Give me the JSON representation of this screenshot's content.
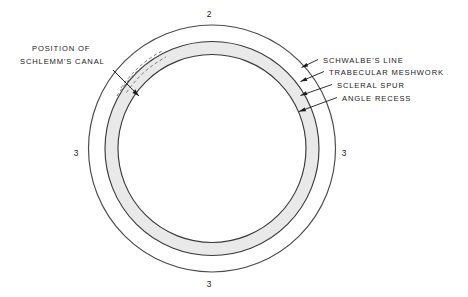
{
  "figure": {
    "background_color": "#ffffff",
    "ink_color": "#1a1a1a",
    "band_fill_color": "#e9e9e9",
    "band_stroke_color": "#3a3a3a",
    "outer_circle_stroke_color": "#4a4a4a"
  },
  "labels": {
    "left": {
      "name": "position-of-schlemms-canal",
      "line1": "POSITION OF",
      "line2": "SCHLEMM'S CANAL"
    },
    "right": [
      {
        "name": "schwalbes-line",
        "text": "SCHWALBE'S LINE"
      },
      {
        "name": "trabecular-meshwork",
        "text": "TRABECULAR MESHWORK"
      },
      {
        "name": "scleral-spur",
        "text": "SCLERAL SPUR"
      },
      {
        "name": "angle-recess",
        "text": "ANGLE RECESS"
      }
    ]
  },
  "callout_numbers": [
    {
      "name": "callout-number-top",
      "value": "2",
      "position": "top"
    },
    {
      "name": "callout-number-left",
      "value": "3",
      "position": "left"
    },
    {
      "name": "callout-number-right",
      "value": "3",
      "position": "right"
    },
    {
      "name": "callout-number-bottom",
      "value": "3",
      "position": "bottom"
    }
  ]
}
